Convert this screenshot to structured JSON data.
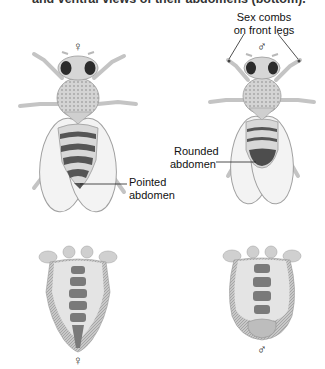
{
  "caption": "and ventral views of their abdomens (bottom).",
  "dorsal": {
    "female": {
      "symbol": "♀",
      "label_line1": "Pointed",
      "label_line2": "abdomen"
    },
    "male": {
      "symbol": "♂",
      "top_label_line1": "Sex combs",
      "top_label_line2": "on front legs",
      "label_line1": "Rounded",
      "label_line2": "abdomen"
    }
  },
  "ventral": {
    "female": {
      "symbol": "♀"
    },
    "male": {
      "symbol": "♂"
    }
  },
  "colors": {
    "body": "#d9d9d9",
    "body_dark": "#555555",
    "wing_outline": "#9a9a9a",
    "eye": "#2b2b2b",
    "line": "#222222"
  }
}
